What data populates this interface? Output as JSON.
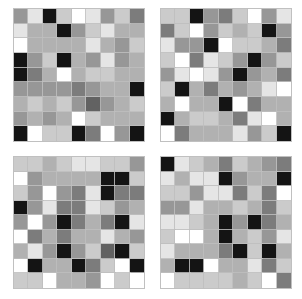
{
  "figure": {
    "title": "",
    "background_color": "#ffffff",
    "panel_count": 4,
    "gridline_color": "#bebebe",
    "panel_border_color": "#c8c8c8"
  },
  "chart_data": {
    "type": "heatmap",
    "title": "",
    "subtitle": "",
    "xlabel": "",
    "ylabel": "",
    "grid": true,
    "legend": "none",
    "colormap": "grayscale",
    "value_range": [
      0,
      9
    ],
    "cell_rows": 9,
    "cell_cols": 9,
    "layout": {
      "rows": 2,
      "cols": 2
    },
    "panels": [
      {
        "name": "panel-top-left",
        "position": "top-left",
        "row_labels": [
          "1",
          "2",
          "3",
          "4",
          "5",
          "6",
          "7",
          "8",
          "9"
        ],
        "col_labels": [
          "1",
          "2",
          "3",
          "4",
          "5",
          "6",
          "7",
          "8",
          "9"
        ],
        "values": [
          [
            5,
            8,
            0,
            7,
            9,
            8,
            5,
            7,
            4
          ],
          [
            8,
            6,
            6,
            0,
            5,
            7,
            8,
            6,
            6
          ],
          [
            9,
            6,
            6,
            6,
            6,
            8,
            6,
            5,
            7
          ],
          [
            0,
            5,
            7,
            0,
            6,
            5,
            8,
            5,
            6
          ],
          [
            0,
            4,
            6,
            9,
            6,
            7,
            7,
            6,
            6
          ],
          [
            5,
            5,
            5,
            5,
            4,
            5,
            6,
            6,
            0
          ],
          [
            6,
            7,
            6,
            7,
            5,
            3,
            5,
            6,
            7
          ],
          [
            5,
            6,
            5,
            6,
            9,
            7,
            6,
            6,
            6
          ],
          [
            0,
            9,
            7,
            7,
            0,
            4,
            9,
            5,
            0
          ]
        ]
      },
      {
        "name": "panel-top-right",
        "position": "top-right",
        "row_labels": [
          "1",
          "2",
          "3",
          "4",
          "5",
          "6",
          "7",
          "8",
          "9"
        ],
        "col_labels": [
          "1",
          "2",
          "3",
          "4",
          "5",
          "6",
          "7",
          "8",
          "9"
        ],
        "values": [
          [
            7,
            7,
            0,
            5,
            4,
            7,
            9,
            5,
            8
          ],
          [
            4,
            7,
            9,
            5,
            7,
            6,
            7,
            0,
            5
          ],
          [
            8,
            5,
            5,
            0,
            9,
            7,
            7,
            6,
            4
          ],
          [
            7,
            9,
            4,
            8,
            7,
            5,
            0,
            5,
            7
          ],
          [
            5,
            8,
            9,
            8,
            5,
            0,
            5,
            6,
            4
          ],
          [
            7,
            0,
            6,
            4,
            6,
            5,
            6,
            8,
            9
          ],
          [
            6,
            9,
            6,
            6,
            0,
            9,
            4,
            6,
            6
          ],
          [
            0,
            6,
            7,
            7,
            6,
            4,
            8,
            9,
            6
          ],
          [
            9,
            4,
            6,
            6,
            6,
            8,
            5,
            7,
            0
          ]
        ]
      },
      {
        "name": "panel-bottom-left",
        "position": "bottom-left",
        "row_labels": [
          "1",
          "2",
          "3",
          "4",
          "5",
          "6",
          "7",
          "8",
          "9"
        ],
        "col_labels": [
          "1",
          "2",
          "3",
          "4",
          "5",
          "6",
          "7",
          "8",
          "9"
        ],
        "values": [
          [
            7,
            7,
            6,
            7,
            8,
            8,
            7,
            7,
            5
          ],
          [
            9,
            5,
            6,
            6,
            6,
            6,
            0,
            0,
            7
          ],
          [
            7,
            5,
            9,
            5,
            4,
            8,
            0,
            4,
            4
          ],
          [
            0,
            5,
            8,
            4,
            4,
            8,
            7,
            5,
            6
          ],
          [
            5,
            9,
            5,
            0,
            4,
            6,
            4,
            0,
            8
          ],
          [
            9,
            4,
            6,
            4,
            6,
            6,
            8,
            6,
            5
          ],
          [
            6,
            8,
            5,
            0,
            5,
            7,
            3,
            0,
            7
          ],
          [
            9,
            0,
            6,
            6,
            0,
            4,
            7,
            9,
            0
          ],
          [
            7,
            7,
            9,
            6,
            6,
            5,
            9,
            7,
            9
          ]
        ]
      },
      {
        "name": "panel-bottom-right",
        "position": "bottom-right",
        "row_labels": [
          "1",
          "2",
          "3",
          "4",
          "5",
          "6",
          "7",
          "8",
          "9"
        ],
        "col_labels": [
          "1",
          "2",
          "3",
          "4",
          "5",
          "6",
          "7",
          "8",
          "9"
        ],
        "values": [
          [
            0,
            8,
            7,
            6,
            4,
            7,
            6,
            5,
            4
          ],
          [
            8,
            6,
            8,
            8,
            0,
            5,
            6,
            6,
            0
          ],
          [
            7,
            7,
            5,
            8,
            8,
            4,
            7,
            4,
            9
          ],
          [
            5,
            5,
            8,
            6,
            6,
            7,
            6,
            4,
            7
          ],
          [
            8,
            8,
            7,
            6,
            0,
            5,
            0,
            4,
            6
          ],
          [
            7,
            9,
            9,
            6,
            0,
            6,
            7,
            5,
            8
          ],
          [
            8,
            6,
            6,
            6,
            4,
            0,
            7,
            0,
            6
          ],
          [
            6,
            0,
            0,
            9,
            6,
            6,
            8,
            4,
            7
          ],
          [
            9,
            7,
            7,
            7,
            7,
            6,
            7,
            9,
            4
          ]
        ]
      }
    ]
  }
}
